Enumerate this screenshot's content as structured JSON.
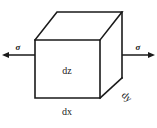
{
  "figure": {
    "type": "stress-element-cube",
    "background_color": "#ffffff",
    "line_color": "#1a1a1a",
    "labels": {
      "dimension_x": "dx",
      "dimension_y": "dy",
      "dimension_z": "dz",
      "stress_left": "σ",
      "stress_right": "σ"
    },
    "geometry": {
      "front_face": {
        "top_left": [
          35,
          40
        ],
        "top_right": [
          100,
          40
        ],
        "bottom_right": [
          100,
          98
        ],
        "bottom_left": [
          35,
          98
        ]
      },
      "back_offset": [
        22,
        -28
      ],
      "top_back_left": [
        57,
        12
      ],
      "top_back_right": [
        122,
        12
      ],
      "bottom_back_right": [
        122,
        78
      ]
    },
    "stress_axis": {
      "y": 55,
      "left_start": 2,
      "left_end": 40,
      "right_start": 118,
      "right_end": 155,
      "direction_left": "outward-left",
      "direction_right": "outward-right"
    }
  }
}
